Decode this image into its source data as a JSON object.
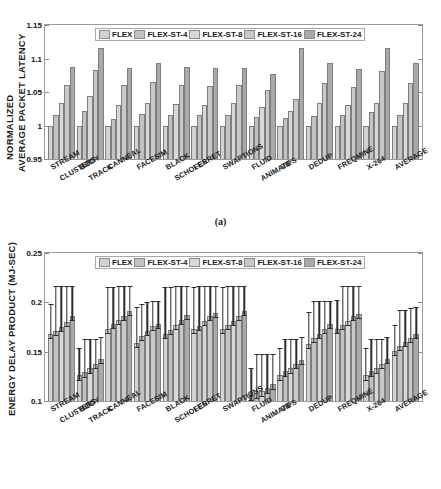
{
  "figure": {
    "legend_series": [
      "FLEX",
      "FLEX-ST-4",
      "FLEX-ST-8",
      "FLEX-ST-16",
      "FLEX-ST-24"
    ],
    "series_colors": [
      "#d2d2d2",
      "#c2c2c2",
      "#d8d8d8",
      "#c8c8c8",
      "#a9a9a9"
    ],
    "captions": {
      "a": "(a)",
      "b": "(b)"
    }
  },
  "chart_data": [
    {
      "type": "bar",
      "panel": "(a)",
      "title": "",
      "xlabel": "",
      "ylabel": "NORMALIZED AVERAGE PACKET LATENCY",
      "ylabel_line1": "NORMALIZED",
      "ylabel_line2": "AVERAGE PACKET LATENCY",
      "ylim": [
        0.95,
        1.15
      ],
      "yticks": [
        0.95,
        1,
        1.05,
        1.1,
        1.15
      ],
      "ytick_labels": [
        "0.95",
        "1",
        "1.05",
        "1.1",
        "1.15"
      ],
      "grid": false,
      "legend_position": "top-center",
      "categories": [
        "STREAM CLUSTERS",
        "BODY TRACK",
        "CANNEAL",
        "FACESIM",
        "BLACK SCHOLES",
        "FERRET",
        "SWAPTIONS",
        "FLUID ANIMATE",
        "VIPS",
        "DEDUP",
        "FREQMINE",
        "X-264",
        "AVERAGE"
      ],
      "category_lines": [
        [
          "STREAM",
          "CLUSTERS"
        ],
        [
          "BODY",
          "TRACK"
        ],
        [
          "CANNEAL"
        ],
        [
          "FACESIM"
        ],
        [
          "BLACK",
          "SCHOLES"
        ],
        [
          "FERRET"
        ],
        [
          "SWAPTIONS"
        ],
        [
          "FLUID",
          "ANIMATE"
        ],
        [
          "VIPS"
        ],
        [
          "DEDUP"
        ],
        [
          "FREQMINE"
        ],
        [
          "X-264"
        ],
        [
          "AVERAGE"
        ]
      ],
      "series": [
        {
          "name": "FLEX",
          "values": [
            1.0,
            1.0,
            1.0,
            1.0,
            1.0,
            1.0,
            1.0,
            1.0,
            1.0,
            1.0,
            0.999,
            1.0,
            0.999
          ]
        },
        {
          "name": "FLEX-ST-4",
          "values": [
            1.015,
            1.021,
            1.009,
            1.017,
            1.015,
            1.015,
            1.015,
            1.012,
            1.011,
            1.014,
            1.015,
            1.02,
            1.015
          ]
        },
        {
          "name": "FLEX-ST-8",
          "values": [
            1.033,
            1.044,
            1.031,
            1.034,
            1.032,
            1.031,
            1.033,
            1.027,
            1.021,
            1.034,
            1.03,
            1.034,
            1.034
          ]
        },
        {
          "name": "FLEX-ST-16",
          "values": [
            1.061,
            1.083,
            1.06,
            1.065,
            1.06,
            1.059,
            1.06,
            1.053,
            1.039,
            1.064,
            1.058,
            1.081,
            1.063
          ]
        },
        {
          "name": "FLEX-ST-24",
          "values": [
            1.088,
            1.116,
            1.086,
            1.093,
            1.088,
            1.086,
            1.086,
            1.077,
            1.116,
            1.093,
            1.085,
            1.116,
            1.094
          ]
        }
      ]
    },
    {
      "type": "bar",
      "panel": "(b)",
      "title": "",
      "xlabel": "",
      "ylabel": "ENERGY DELAY PRODUCT (MJ-SEC)",
      "ylim": [
        0.1,
        0.25
      ],
      "yticks": [
        0.1,
        0.15,
        0.2,
        0.25
      ],
      "ytick_labels": [
        "0.1",
        "0.15",
        "0.2",
        "0.25"
      ],
      "grid": false,
      "legend_position": "top-center",
      "has_error_bars": true,
      "categories": [
        "STREAM CLUSTERS",
        "BODY TRACK",
        "CANNEAL",
        "FACESIM",
        "BLACK SCHOLES",
        "FERRET",
        "SWAPTIONS",
        "FLUID ANIMATE",
        "VIPS",
        "DEDUP",
        "FREQMINE",
        "X-264",
        "AVERAGE"
      ],
      "category_lines": [
        [
          "STREAM",
          "CLUSTERS"
        ],
        [
          "BODY",
          "TRACK"
        ],
        [
          "CANNEAL"
        ],
        [
          "FACESIM"
        ],
        [
          "BLACK",
          "SCHOLES"
        ],
        [
          "FERRET"
        ],
        [
          "SWAPTIONS"
        ],
        [
          "FLUID",
          "ANIMATE"
        ],
        [
          "VIPS"
        ],
        [
          "DEDUP"
        ],
        [
          "FREQMINE"
        ],
        [
          "X-264"
        ],
        [
          "AVERAGE"
        ]
      ],
      "series": [
        {
          "name": "FLEX",
          "values": [
            0.168,
            0.126,
            0.173,
            0.159,
            0.168,
            0.173,
            0.173,
            0.106,
            0.126,
            0.158,
            0.173,
            0.126,
            0.151
          ],
          "err_high": [
            0.196,
            0.152,
            0.213,
            0.193,
            0.213,
            0.213,
            0.213,
            0.132,
            0.152,
            0.188,
            0.2,
            0.152,
            0.175
          ]
        },
        {
          "name": "FLEX-ST-4",
          "values": [
            0.171,
            0.129,
            0.178,
            0.166,
            0.172,
            0.176,
            0.177,
            0.108,
            0.13,
            0.164,
            0.177,
            0.13,
            0.156
          ],
          "err_high": [
            0.214,
            0.161,
            0.213,
            0.196,
            0.213,
            0.214,
            0.214,
            0.146,
            0.161,
            0.199,
            0.214,
            0.161,
            0.19
          ]
        },
        {
          "name": "FLEX-ST-8",
          "values": [
            0.175,
            0.133,
            0.182,
            0.171,
            0.177,
            0.181,
            0.181,
            0.11,
            0.133,
            0.168,
            0.181,
            0.133,
            0.16
          ],
          "err_high": [
            0.214,
            0.161,
            0.214,
            0.198,
            0.214,
            0.214,
            0.214,
            0.146,
            0.161,
            0.199,
            0.214,
            0.161,
            0.19
          ]
        },
        {
          "name": "FLEX-ST-16",
          "values": [
            0.18,
            0.138,
            0.186,
            0.176,
            0.182,
            0.186,
            0.186,
            0.113,
            0.138,
            0.173,
            0.186,
            0.138,
            0.164
          ],
          "err_high": [
            0.214,
            0.161,
            0.214,
            0.199,
            0.214,
            0.214,
            0.214,
            0.146,
            0.161,
            0.199,
            0.214,
            0.161,
            0.192
          ]
        },
        {
          "name": "FLEX-ST-24",
          "values": [
            0.186,
            0.143,
            0.191,
            0.178,
            0.187,
            0.189,
            0.191,
            0.117,
            0.142,
            0.178,
            0.188,
            0.143,
            0.168
          ],
          "err_high": [
            0.214,
            0.163,
            0.214,
            0.199,
            0.214,
            0.214,
            0.214,
            0.146,
            0.163,
            0.199,
            0.214,
            0.163,
            0.193
          ]
        }
      ]
    }
  ]
}
